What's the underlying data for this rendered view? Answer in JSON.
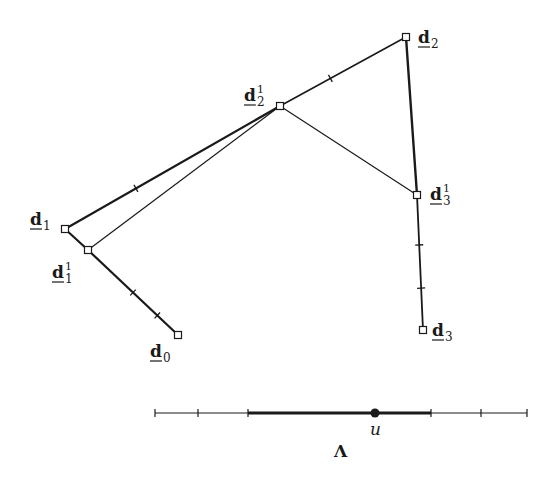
{
  "diagram": {
    "colors": {
      "ink": "#1a1a1a",
      "background": "#ffffff"
    },
    "control_points": [
      {
        "id": "d0",
        "base": "d",
        "sub": "0",
        "sup": "",
        "x": 178,
        "y": 335,
        "lx": 150,
        "ly": 357
      },
      {
        "id": "d1",
        "base": "d",
        "sub": "1",
        "sup": "",
        "x": 65,
        "y": 229,
        "lx": 30,
        "ly": 225
      },
      {
        "id": "d2",
        "base": "d",
        "sub": "2",
        "sup": "",
        "x": 406,
        "y": 37,
        "lx": 418,
        "ly": 43
      },
      {
        "id": "d3",
        "base": "d",
        "sub": "3",
        "sup": "",
        "x": 423,
        "y": 330,
        "lx": 432,
        "ly": 336
      }
    ],
    "intermediate_points": [
      {
        "id": "d1_1",
        "base": "d",
        "sub": "1",
        "sup": "1",
        "x": 88,
        "y": 250,
        "lx": 52,
        "ly": 278
      },
      {
        "id": "d2_1",
        "base": "d",
        "sub": "2",
        "sup": "1",
        "x": 280,
        "y": 106,
        "lx": 244,
        "ly": 101
      },
      {
        "id": "d3_1",
        "base": "d",
        "sub": "3",
        "sup": "1",
        "x": 417,
        "y": 195,
        "lx": 430,
        "ly": 200
      }
    ],
    "knot_axis": {
      "label": "Λ",
      "param_label": "u",
      "y": 413,
      "x_start": 155,
      "x_end": 527,
      "ticks": [
        155,
        198,
        248,
        431,
        481,
        527
      ],
      "thick_from": 248,
      "thick_to": 431,
      "u_x": 375
    }
  }
}
